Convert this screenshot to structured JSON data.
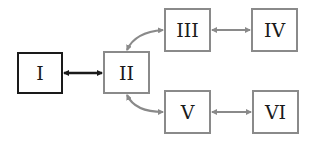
{
  "diagram": {
    "nodes": [
      {
        "id": "I",
        "label": "I",
        "x": 17,
        "y": 52,
        "w": 46,
        "h": 42,
        "style": "dark"
      },
      {
        "id": "II",
        "label": "II",
        "x": 103,
        "y": 51,
        "w": 47,
        "h": 43,
        "style": "gray"
      },
      {
        "id": "III",
        "label": "III",
        "x": 164,
        "y": 8,
        "w": 47,
        "h": 44,
        "style": "gray"
      },
      {
        "id": "IV",
        "label": "IV",
        "x": 251,
        "y": 8,
        "w": 47,
        "h": 44,
        "style": "gray"
      },
      {
        "id": "V",
        "label": "V",
        "x": 164,
        "y": 90,
        "w": 47,
        "h": 44,
        "style": "gray"
      },
      {
        "id": "VI",
        "label": "VI",
        "x": 252,
        "y": 90,
        "w": 47,
        "h": 44,
        "style": "gray"
      }
    ],
    "edges": [
      {
        "from": "I",
        "to": "II",
        "type": "bidirectional",
        "color": "#1a1a1a"
      },
      {
        "from": "II",
        "to": "III",
        "type": "bidirectional-curved",
        "color": "#8a8a8a"
      },
      {
        "from": "II",
        "to": "V",
        "type": "bidirectional-curved",
        "color": "#8a8a8a"
      },
      {
        "from": "III",
        "to": "IV",
        "type": "bidirectional",
        "color": "#8a8a8a"
      },
      {
        "from": "V",
        "to": "VI",
        "type": "bidirectional",
        "color": "#8a8a8a"
      }
    ],
    "colors": {
      "dark": "#1a1a1a",
      "gray": "#8a8a8a",
      "background": "#ffffff"
    }
  }
}
